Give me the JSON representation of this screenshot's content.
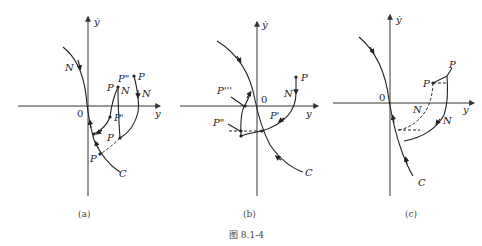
{
  "figure": {
    "caption": "图 8.1-4",
    "panels": [
      {
        "id": "a",
        "sublabel": "(a)",
        "axes": {
          "y_axis_label": "ẏ",
          "x_axis_label": "y",
          "origin_label": "0"
        },
        "labels": [
          "N",
          "P\"",
          "P",
          "P",
          "N",
          "N",
          "P'",
          "P",
          "P",
          "C"
        ]
      },
      {
        "id": "b",
        "sublabel": "(b)",
        "axes": {
          "y_axis_label": "ẏ",
          "x_axis_label": "y",
          "origin_label": "0"
        },
        "labels": [
          "P'''",
          "P\"",
          "P",
          "N",
          "P'",
          "C"
        ]
      },
      {
        "id": "c",
        "sublabel": "(c)",
        "axes": {
          "y_axis_label": "ẏ",
          "x_axis_label": "y",
          "origin_label": "0"
        },
        "labels": [
          "P",
          "P",
          "N",
          "N",
          "C"
        ]
      }
    ]
  }
}
